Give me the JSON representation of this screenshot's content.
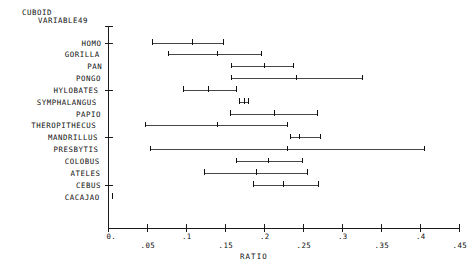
{
  "title": {
    "line1": "CUBOID",
    "line2": "VARIABLE",
    "number": "49"
  },
  "axis": {
    "x_label": "RATIO",
    "x_ticks": [
      "0.",
      ".05",
      ".1",
      ".15",
      ".2",
      ".25",
      ".3",
      ".35",
      ".4",
      ".45"
    ],
    "x_tick_values": [
      0,
      0.05,
      0.1,
      0.15,
      0.2,
      0.25,
      0.3,
      0.35,
      0.4,
      0.45
    ]
  },
  "chart_data": {
    "type": "scatter",
    "title": "CUBOID VARIABLE 49",
    "xlabel": "RATIO",
    "ylabel": "",
    "xlim": [
      0,
      0.45
    ],
    "grid": false,
    "legend": "none",
    "note": "Each row is a horizontal range line with tick marks at minimum, mean and maximum ratio values for that genus.",
    "categories": [
      "HOMO",
      "GORILLA",
      "PAN",
      "PONGO",
      "HYLOBATES",
      "SYMPHALANGUS",
      "PAPIO",
      "THEROPITHECUS",
      "MANDRILLUS",
      "PRESBYTIS",
      "COLOBUS",
      "ATELES",
      "CEBUS",
      "CACAJAO"
    ],
    "series": [
      {
        "name": "minimum",
        "values": [
          0.056,
          0.077,
          0.158,
          0.158,
          0.096,
          0.168,
          0.156,
          0.047,
          0.233,
          0.054,
          0.164,
          0.123,
          0.186,
          0.005
        ]
      },
      {
        "name": "mean",
        "values": [
          0.108,
          0.14,
          0.2,
          0.241,
          0.128,
          0.174,
          0.213,
          0.14,
          0.245,
          0.229,
          0.205,
          0.19,
          0.224,
          0.005
        ]
      },
      {
        "name": "maximum",
        "values": [
          0.147,
          0.196,
          0.237,
          0.326,
          0.164,
          0.179,
          0.268,
          0.229,
          0.272,
          0.405,
          0.249,
          0.255,
          0.269,
          0.005
        ]
      }
    ],
    "rows": [
      {
        "label": "HOMO",
        "min": 0.056,
        "mean": 0.108,
        "max": 0.147
      },
      {
        "label": "GORILLA",
        "min": 0.077,
        "mean": 0.14,
        "max": 0.196
      },
      {
        "label": "PAN",
        "min": 0.158,
        "mean": 0.2,
        "max": 0.237
      },
      {
        "label": "PONGO",
        "min": 0.158,
        "mean": 0.241,
        "max": 0.326
      },
      {
        "label": "HYLOBATES",
        "min": 0.096,
        "mean": 0.128,
        "max": 0.164
      },
      {
        "label": "SYMPHALANGUS",
        "min": 0.168,
        "mean": 0.174,
        "max": 0.179
      },
      {
        "label": "PAPIO",
        "min": 0.156,
        "mean": 0.213,
        "max": 0.268
      },
      {
        "label": "THEROPITHECUS",
        "min": 0.047,
        "mean": 0.14,
        "max": 0.229
      },
      {
        "label": "MANDRILLUS",
        "min": 0.233,
        "mean": 0.245,
        "max": 0.272
      },
      {
        "label": "PRESBYTIS",
        "min": 0.054,
        "mean": 0.229,
        "max": 0.405
      },
      {
        "label": "COLOBUS",
        "min": 0.164,
        "mean": 0.205,
        "max": 0.249
      },
      {
        "label": "ATELES",
        "min": 0.123,
        "mean": 0.19,
        "max": 0.255
      },
      {
        "label": "CEBUS",
        "min": 0.186,
        "mean": 0.224,
        "max": 0.269
      },
      {
        "label": "CACAJAO",
        "min": 0.005,
        "mean": 0.005,
        "max": 0.005
      }
    ]
  }
}
